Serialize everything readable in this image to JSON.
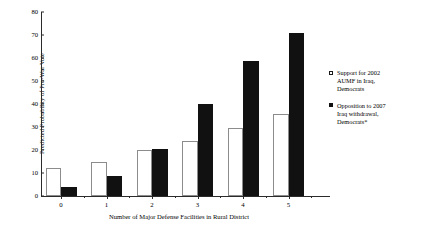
{
  "chart_data": {
    "type": "bar",
    "title": "",
    "xlabel": "Number of Major Defense Facilities in Rural District",
    "ylabel": "Predicted Probability of Pro-War Vote",
    "categories": [
      "0",
      "1",
      "2",
      "3",
      "4",
      "5"
    ],
    "ylim": [
      0,
      80
    ],
    "yticks": [
      "0",
      "10",
      "20",
      "30",
      "40",
      "50",
      "60",
      "70",
      "80"
    ],
    "grid": false,
    "legend_position": "right",
    "series": [
      {
        "name": "Support for 2002 AUMF in Iraq, Democrats",
        "color": "#ffffff",
        "edge_color": "#8c8c8c",
        "values": [
          12,
          15,
          20,
          24,
          29.5,
          35.5
        ]
      },
      {
        "name": "Opposition to 2007 Iraq withdrawal, Democrats*",
        "color": "#111111",
        "edge_color": "#111111",
        "values": [
          4,
          8.5,
          20.5,
          40,
          58.5,
          71
        ]
      }
    ]
  },
  "legend": {
    "items": [
      {
        "swatch": "white",
        "line1": "Support for 2002",
        "line2": "AUMF in Iraq,",
        "line3": "Democrats"
      },
      {
        "swatch": "black",
        "line1": "Opposition to 2007",
        "line2": "Iraq withdrawal,",
        "line3": "Democrats*"
      }
    ]
  }
}
